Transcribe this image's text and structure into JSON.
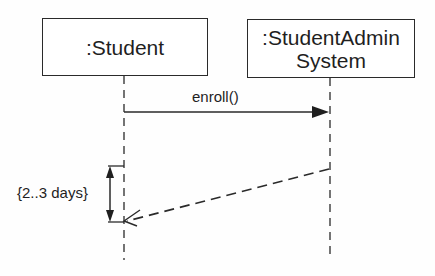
{
  "diagram": {
    "type": "UML sequence diagram",
    "lifelines": [
      {
        "id": "student",
        "label": ":Student"
      },
      {
        "id": "system",
        "label_line1": ":StudentAdmin",
        "label_line2": "System"
      }
    ],
    "messages": [
      {
        "id": "enroll",
        "label": "enroll()",
        "from": "student",
        "to": "system",
        "style": "solid, filled arrowhead"
      },
      {
        "id": "reply",
        "label": "",
        "from": "system",
        "to": "student",
        "style": "dashed, open arrowhead"
      }
    ],
    "constraints": [
      {
        "id": "duration",
        "label": "{2..3 days}",
        "on": "student"
      }
    ]
  },
  "colors": {
    "line": "#2a2a2a",
    "text": "#1f1f1f",
    "background": "#fefefe"
  }
}
